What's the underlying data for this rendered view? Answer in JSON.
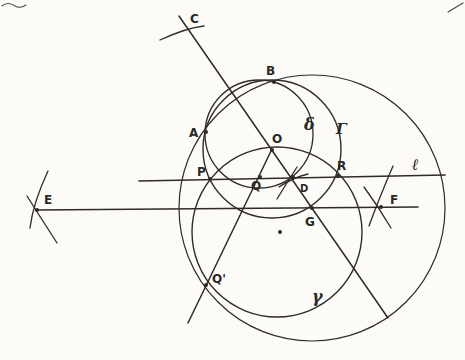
{
  "canvas": {
    "width": 465,
    "height": 360,
    "background": "#fcfbf8",
    "ink": "#2e2b28",
    "artifact_ink": "#4a4744"
  },
  "figure": {
    "circles": [
      {
        "name": "circle-delta",
        "label": "δ",
        "cx": 259,
        "cy": 134,
        "r": 54,
        "stroke_width": 1.3
      },
      {
        "name": "circle-Gamma",
        "label": "Γ",
        "cx": 272,
        "cy": 149,
        "r": 69,
        "stroke_width": 1.4
      },
      {
        "name": "circle-middle",
        "label": "",
        "cx": 277,
        "cy": 232,
        "r": 85,
        "stroke_width": 1.4
      },
      {
        "name": "circle-gamma",
        "label": "γ",
        "cx": 312,
        "cy": 208,
        "r": 133,
        "stroke_width": 1.2
      }
    ],
    "lines": [
      {
        "name": "line-l",
        "label": "ℓ",
        "x1": 139,
        "y1": 181,
        "x2": 445,
        "y2": 175,
        "stroke_width": 1.7
      },
      {
        "name": "line-E-F",
        "label": "",
        "x1": 37,
        "y1": 210,
        "x2": 418,
        "y2": 207,
        "stroke_width": 1.5
      },
      {
        "name": "line-C-O-D-G",
        "label": "",
        "x1": 179,
        "y1": 16,
        "x2": 388,
        "y2": 318,
        "stroke_width": 1.5
      },
      {
        "name": "line-O-Q-Qprime",
        "label": "",
        "x1": 272,
        "y1": 149,
        "x2": 188,
        "y2": 323,
        "stroke_width": 1.5
      }
    ],
    "tick_arcs": [
      {
        "name": "tick-C",
        "d": "M160,40 Q186,28 204,26"
      },
      {
        "name": "tick-E-1",
        "d": "M48,171 Q33,203 30,228"
      },
      {
        "name": "tick-E-2",
        "d": "M27,196 Q39,215 57,243"
      },
      {
        "name": "tick-F-1",
        "d": "M393,166 Q378,201 369,226"
      },
      {
        "name": "tick-F-2",
        "d": "M364,187 Q378,206 391,228"
      },
      {
        "name": "tick-D-1",
        "d": "M279,187 Q294,177 308,174"
      },
      {
        "name": "tick-D-2",
        "d": "M277,199 Q288,181 297,167"
      }
    ],
    "artifacts": [
      {
        "name": "artifact-top-left",
        "d": "M2,6 Q8,1 15,6 Q20,9 26,5"
      },
      {
        "name": "artifact-top-right",
        "d": "M448,12 L463,3"
      }
    ],
    "points": [
      {
        "name": "point-B",
        "label": "B",
        "x": 274,
        "y": 82,
        "lx": 266,
        "ly": 75,
        "size": 12
      },
      {
        "name": "point-A",
        "label": "A",
        "x": 206,
        "y": 132,
        "lx": 189,
        "ly": 137,
        "size": 12
      },
      {
        "name": "point-O",
        "label": "O",
        "x": 272,
        "y": 150,
        "lx": 272,
        "ly": 143,
        "size": 12
      },
      {
        "name": "point-P",
        "label": "P",
        "x": 210,
        "y": 179,
        "lx": 197,
        "ly": 176,
        "size": 12
      },
      {
        "name": "point-Q",
        "label": "Q",
        "x": 260,
        "y": 177,
        "lx": 251,
        "ly": 190,
        "size": 12
      },
      {
        "name": "point-R",
        "label": "R",
        "x": 338,
        "y": 176,
        "lx": 337,
        "ly": 170,
        "size": 12
      },
      {
        "name": "point-D",
        "label": "D",
        "x": 293,
        "y": 177,
        "lx": 300,
        "ly": 192,
        "size": 10
      },
      {
        "name": "point-G",
        "label": "G",
        "x": 312,
        "y": 208,
        "lx": 305,
        "ly": 226,
        "size": 12
      },
      {
        "name": "point-E",
        "label": "E",
        "x": 37,
        "y": 210,
        "lx": 44,
        "ly": 204,
        "size": 12
      },
      {
        "name": "point-F",
        "label": "F",
        "x": 381,
        "y": 207,
        "lx": 390,
        "ly": 204,
        "size": 12
      },
      {
        "name": "point-Qprime",
        "label": "Q'",
        "x": 206,
        "y": 285,
        "lx": 212,
        "ly": 283,
        "size": 12
      },
      {
        "name": "point-center-dot",
        "label": "",
        "x": 280,
        "y": 232,
        "lx": 0,
        "ly": 0,
        "size": 0
      }
    ],
    "curve_labels": [
      {
        "name": "label-C",
        "text": "C",
        "x": 190,
        "y": 23,
        "size": 12,
        "italic": false
      },
      {
        "name": "label-delta",
        "text": "δ",
        "x": 304,
        "y": 130,
        "size": 16,
        "italic": true
      },
      {
        "name": "label-Gamma",
        "text": "Γ",
        "x": 336,
        "y": 134,
        "size": 15,
        "italic": true
      },
      {
        "name": "label-l",
        "text": "ℓ",
        "x": 412,
        "y": 170,
        "size": 16,
        "italic": true
      },
      {
        "name": "label-gamma",
        "text": "γ",
        "x": 312,
        "y": 302,
        "size": 16,
        "italic": true
      }
    ]
  }
}
